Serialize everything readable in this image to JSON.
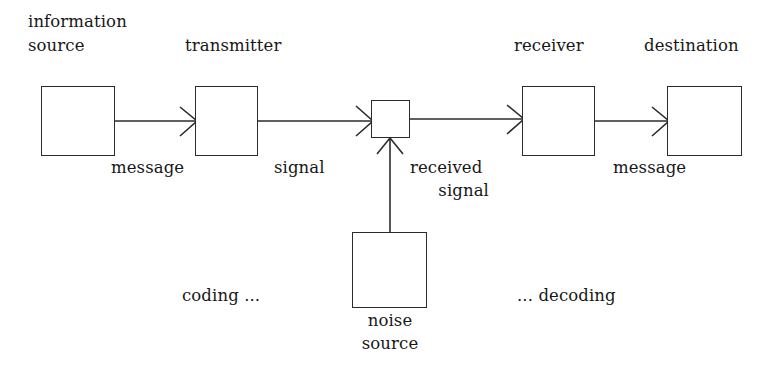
{
  "diagram": {
    "canvas": {
      "width": 777,
      "height": 375
    },
    "style": {
      "background_color": "#ffffff",
      "stroke_color": "#2b2b2b",
      "text_color": "#171717"
    },
    "nodes": [
      {
        "id": "information-source",
        "label": "information\nsource",
        "label_line1": "information",
        "label_line2": "source",
        "label_position": "above",
        "box": {
          "x": 41,
          "y": 86,
          "w": 74,
          "h": 70
        }
      },
      {
        "id": "transmitter",
        "label": "transmitter",
        "label_position": "above",
        "box": {
          "x": 195,
          "y": 86,
          "w": 63,
          "h": 70
        }
      },
      {
        "id": "channel",
        "label": "",
        "label_position": "none",
        "box": {
          "x": 371,
          "y": 100,
          "w": 39,
          "h": 38
        }
      },
      {
        "id": "receiver",
        "label": "receiver",
        "label_position": "above",
        "box": {
          "x": 522,
          "y": 86,
          "w": 73,
          "h": 70
        }
      },
      {
        "id": "destination",
        "label": "destination",
        "label_position": "above",
        "box": {
          "x": 667,
          "y": 86,
          "w": 75,
          "h": 70
        }
      },
      {
        "id": "noise-source",
        "label": "noise\nsource",
        "label_line1": "noise",
        "label_line2": "source",
        "label_position": "below",
        "box": {
          "x": 352,
          "y": 232,
          "w": 75,
          "h": 76
        }
      }
    ],
    "edges": [
      {
        "id": "source-to-transmitter",
        "from": "information-source",
        "to": "transmitter",
        "label": "message",
        "direction": "right"
      },
      {
        "id": "transmitter-to-channel",
        "from": "transmitter",
        "to": "channel",
        "label": "signal",
        "direction": "right"
      },
      {
        "id": "channel-to-receiver",
        "from": "channel",
        "to": "receiver",
        "label": "received\nsignal",
        "label_line1": "received",
        "label_line2": "signal",
        "direction": "right"
      },
      {
        "id": "receiver-to-destination",
        "from": "receiver",
        "to": "destination",
        "label": "message",
        "direction": "right"
      },
      {
        "id": "noise-to-channel",
        "from": "noise-source",
        "to": "channel",
        "label": "",
        "direction": "up"
      }
    ],
    "annotations": [
      {
        "id": "coding-note",
        "text": "coding ...",
        "x": 182,
        "y": 288
      },
      {
        "id": "decoding-note",
        "text": "... decoding",
        "x": 517,
        "y": 288
      }
    ]
  },
  "labels": {
    "information_source_line1": "information",
    "information_source_line2": "source",
    "transmitter": "transmitter",
    "receiver": "receiver",
    "destination": "destination",
    "noise_source_line1": "noise",
    "noise_source_line2": "source",
    "message_left": "message",
    "signal": "signal",
    "received_signal_line1": "received",
    "received_signal_line2": "signal",
    "message_right": "message",
    "coding": "coding ...",
    "decoding": "... decoding"
  }
}
